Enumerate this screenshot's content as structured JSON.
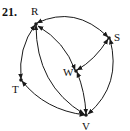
{
  "problem": {
    "number": "21."
  },
  "graph": {
    "type": "directed-graph",
    "nodes": [
      {
        "id": "R",
        "label": "R",
        "x": 36,
        "y": 24
      },
      {
        "id": "S",
        "label": "S",
        "x": 109,
        "y": 38
      },
      {
        "id": "W",
        "label": "W",
        "x": 76,
        "y": 71
      },
      {
        "id": "T",
        "label": "T",
        "x": 21,
        "y": 80
      },
      {
        "id": "V",
        "label": "V",
        "x": 86,
        "y": 115
      }
    ],
    "edges": [
      {
        "from": "R",
        "to": "S"
      },
      {
        "from": "S",
        "to": "R"
      },
      {
        "from": "S",
        "to": "W"
      },
      {
        "from": "W",
        "to": "S"
      },
      {
        "from": "W",
        "to": "R"
      },
      {
        "from": "R",
        "to": "W"
      },
      {
        "from": "W",
        "to": "V"
      },
      {
        "from": "V",
        "to": "W"
      },
      {
        "from": "R",
        "to": "T"
      },
      {
        "from": "T",
        "to": "R"
      },
      {
        "from": "T",
        "to": "V"
      },
      {
        "from": "V",
        "to": "T"
      },
      {
        "from": "V",
        "to": "R"
      },
      {
        "from": "R",
        "to": "V"
      },
      {
        "from": "S",
        "to": "V"
      },
      {
        "from": "V",
        "to": "S"
      }
    ],
    "colors": {
      "stroke": "#1a1a1a",
      "background": "#ffffff"
    }
  }
}
